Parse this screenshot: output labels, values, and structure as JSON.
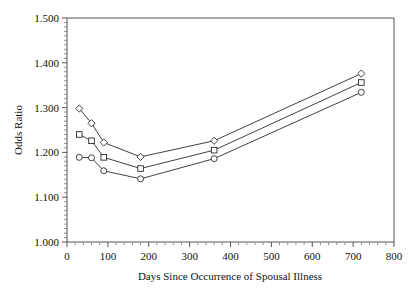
{
  "figure": {
    "title_partial": "",
    "background_color": "#ffffff",
    "axis_color": "#555555",
    "series_color": "#2b2b2b"
  },
  "chart_data": {
    "type": "line",
    "title": "",
    "xlabel": "Days Since Occurrence of Spousal Illness",
    "ylabel": "Odds Ratio",
    "xlim": [
      0,
      800
    ],
    "ylim": [
      1.0,
      1.5
    ],
    "xticks": [
      0,
      100,
      200,
      300,
      400,
      500,
      600,
      700,
      800
    ],
    "xticklabels": [
      "0",
      "100",
      "200",
      "300",
      "400",
      "500",
      "600",
      "700",
      "800"
    ],
    "yticks": [
      1.0,
      1.1,
      1.2,
      1.3,
      1.4,
      1.5
    ],
    "yticklabels": [
      "1.000",
      "1.100",
      "1.200",
      "1.300",
      "1.400",
      "1.500"
    ],
    "grid": false,
    "legend": "none",
    "x": [
      30,
      60,
      90,
      180,
      360,
      720
    ],
    "series": [
      {
        "name": "Upper Confidence Limit",
        "marker": "diamond",
        "values": [
          1.298,
          1.265,
          1.222,
          1.19,
          1.226,
          1.376
        ]
      },
      {
        "name": "Odds Ratio Estimate",
        "marker": "square",
        "values": [
          1.24,
          1.226,
          1.189,
          1.164,
          1.205,
          1.356
        ]
      },
      {
        "name": "Lower Confidence Limit",
        "marker": "circle",
        "values": [
          1.189,
          1.188,
          1.159,
          1.141,
          1.186,
          1.334
        ]
      }
    ]
  }
}
